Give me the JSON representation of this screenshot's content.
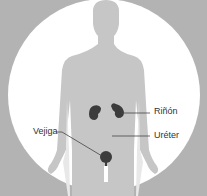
{
  "diagram": {
    "labels": {
      "kidney": "Riñón",
      "ureter": "Uréter",
      "bladder": "Vejiga"
    },
    "colors": {
      "background": "#b3b3b3",
      "circle": "#ffffff",
      "silhouette": "#c6c6c6",
      "organ": "#3c3c3c",
      "line": "#444444",
      "text": "#333333"
    }
  }
}
